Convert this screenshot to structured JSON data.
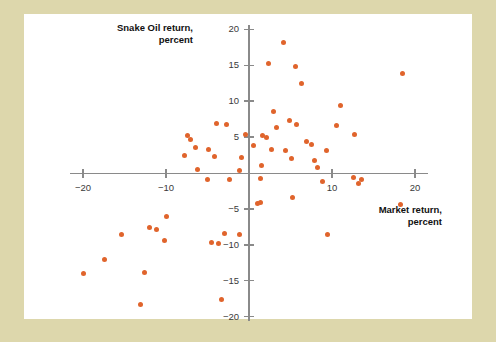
{
  "figure": {
    "mat_color": "#ddd7ac",
    "plate_color": "#ffffff",
    "axis_color": "#8a8a8a",
    "point_color": "#e0642c"
  },
  "chart_data": {
    "type": "scatter",
    "title": "",
    "xlabel": "Market return, percent",
    "ylabel": "Snake Oil return, percent",
    "xlim": [
      -22,
      22
    ],
    "ylim": [
      -21,
      21
    ],
    "xticks": [
      -20,
      -10,
      10,
      20
    ],
    "xticklabels": [
      "−20",
      "−10",
      "10",
      "20"
    ],
    "yticks": [
      20,
      15,
      10,
      5,
      -5,
      -10,
      -15,
      -20
    ],
    "yticklabels": [
      "20",
      "15",
      "10",
      "5",
      "−5",
      "−10",
      "−15",
      "−20"
    ],
    "grid": false,
    "legend": null,
    "series": [
      {
        "name": "Snake Oil vs Market",
        "points": [
          [
            4.2,
            18.2
          ],
          [
            2.4,
            15.2
          ],
          [
            5.6,
            14.9
          ],
          [
            18.5,
            13.9
          ],
          [
            6.3,
            12.4
          ],
          [
            11.0,
            9.4
          ],
          [
            3.0,
            8.6
          ],
          [
            4.9,
            7.3
          ],
          [
            5.7,
            6.7
          ],
          [
            10.5,
            6.6
          ],
          [
            -3.9,
            6.9
          ],
          [
            -2.7,
            6.8
          ],
          [
            3.3,
            6.4
          ],
          [
            -7.4,
            5.2
          ],
          [
            -7.1,
            4.7
          ],
          [
            -0.4,
            5.3
          ],
          [
            1.6,
            5.2
          ],
          [
            2.1,
            5.0
          ],
          [
            12.7,
            5.4
          ],
          [
            6.9,
            4.4
          ],
          [
            7.5,
            4.0
          ],
          [
            -6.5,
            3.6
          ],
          [
            -4.9,
            3.3
          ],
          [
            0.6,
            3.8
          ],
          [
            2.7,
            3.3
          ],
          [
            4.4,
            3.2
          ],
          [
            9.3,
            3.1
          ],
          [
            -7.8,
            2.4
          ],
          [
            -4.1,
            2.3
          ],
          [
            -0.9,
            2.2
          ],
          [
            5.1,
            2.0
          ],
          [
            7.9,
            1.8
          ],
          [
            -6.2,
            0.5
          ],
          [
            -1.2,
            0.4
          ],
          [
            1.5,
            1.1
          ],
          [
            8.3,
            0.8
          ],
          [
            -5.0,
            -0.9
          ],
          [
            -2.4,
            -0.9
          ],
          [
            1.4,
            -0.8
          ],
          [
            12.6,
            -0.6
          ],
          [
            13.6,
            -0.9
          ],
          [
            13.2,
            -1.4
          ],
          [
            8.9,
            -1.2
          ],
          [
            5.3,
            -3.4
          ],
          [
            1.0,
            -4.2
          ],
          [
            1.4,
            -4.1
          ],
          [
            18.2,
            -4.4
          ],
          [
            -9.9,
            -6.0
          ],
          [
            -12.0,
            -7.6
          ],
          [
            -11.2,
            -7.9
          ],
          [
            -3.0,
            -8.4
          ],
          [
            -1.2,
            -8.5
          ],
          [
            9.5,
            -8.6
          ],
          [
            -15.4,
            -8.6
          ],
          [
            -10.2,
            -9.4
          ],
          [
            -4.5,
            -9.7
          ],
          [
            -3.7,
            -9.8
          ],
          [
            -17.4,
            -12.0
          ],
          [
            -12.6,
            -13.9
          ],
          [
            -20.0,
            -14.0
          ],
          [
            -3.3,
            -17.6
          ],
          [
            -13.1,
            -18.3
          ]
        ]
      }
    ]
  },
  "axes": {
    "y_title_line1": "Snake Oil return,",
    "y_title_line2": "percent",
    "x_title_line1": "Market return,",
    "x_title_line2": "percent"
  }
}
